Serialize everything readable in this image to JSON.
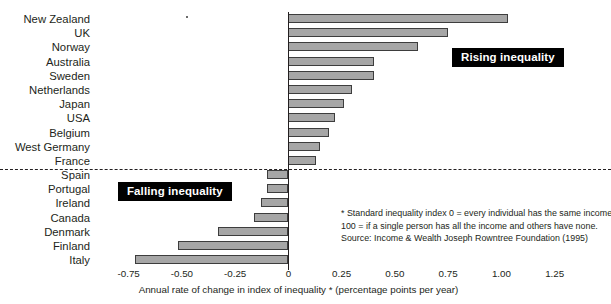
{
  "chart_data": {
    "type": "bar",
    "orientation": "horizontal",
    "title": "",
    "xlabel": "Annual rate of change in index of inequality * (percentage points per year)",
    "ylabel": "",
    "xlim": [
      -0.875,
      1.3125
    ],
    "grid": false,
    "legend": "none",
    "xticks": [
      "-0.75",
      "-0.50",
      "-0.25",
      "0",
      "0.25",
      "0.50",
      "0.75",
      "1.00",
      "1.25"
    ],
    "xtick_values": [
      -0.75,
      -0.5,
      -0.25,
      0,
      0.25,
      0.5,
      0.75,
      1.0,
      1.25
    ],
    "categories": [
      "New Zealand",
      "UK",
      "Norway",
      "Australia",
      "Sweden",
      "Netherlands",
      "Japan",
      "USA",
      "Belgium",
      "West Germany",
      "France",
      "Spain",
      "Portugal",
      "Ireland",
      "Canada",
      "Denmark",
      "Finland",
      "Italy"
    ],
    "values": [
      1.03,
      0.75,
      0.61,
      0.4,
      0.4,
      0.3,
      0.26,
      0.22,
      0.19,
      0.15,
      0.13,
      -0.1,
      -0.1,
      -0.13,
      -0.16,
      -0.33,
      -0.52,
      -0.72
    ],
    "series": [
      {
        "name": "Annual rate of change in index of inequality",
        "values": [
          1.03,
          0.75,
          0.61,
          0.4,
          0.4,
          0.3,
          0.26,
          0.22,
          0.19,
          0.15,
          0.13,
          -0.1,
          -0.1,
          -0.13,
          -0.16,
          -0.33,
          -0.52,
          -0.72
        ]
      }
    ],
    "annotations": [
      {
        "text": "Rising inequality",
        "group": "positive"
      },
      {
        "text": "Falling inequality",
        "group": "negative"
      }
    ],
    "divider_after_category": "France",
    "colors": {
      "bar_fill": "#a6a6a6",
      "bar_stroke": "#3d3d3d",
      "axis": "#231f20",
      "callout_background": "#000000",
      "callout_text": "#ffffff"
    }
  },
  "callouts": {
    "rising": "Rising inequality",
    "falling": "Falling inequality"
  },
  "footnote": {
    "line1": "* Standard inequality index 0 = every individual has the same income;",
    "line2": "100 = if a single person has all the income and others have none.",
    "line3": "Source: Income & Wealth Joseph Rowntree Foundation (1995)"
  },
  "axis": {
    "title": "Annual rate of change in index of inequality * (percentage points per year)"
  }
}
